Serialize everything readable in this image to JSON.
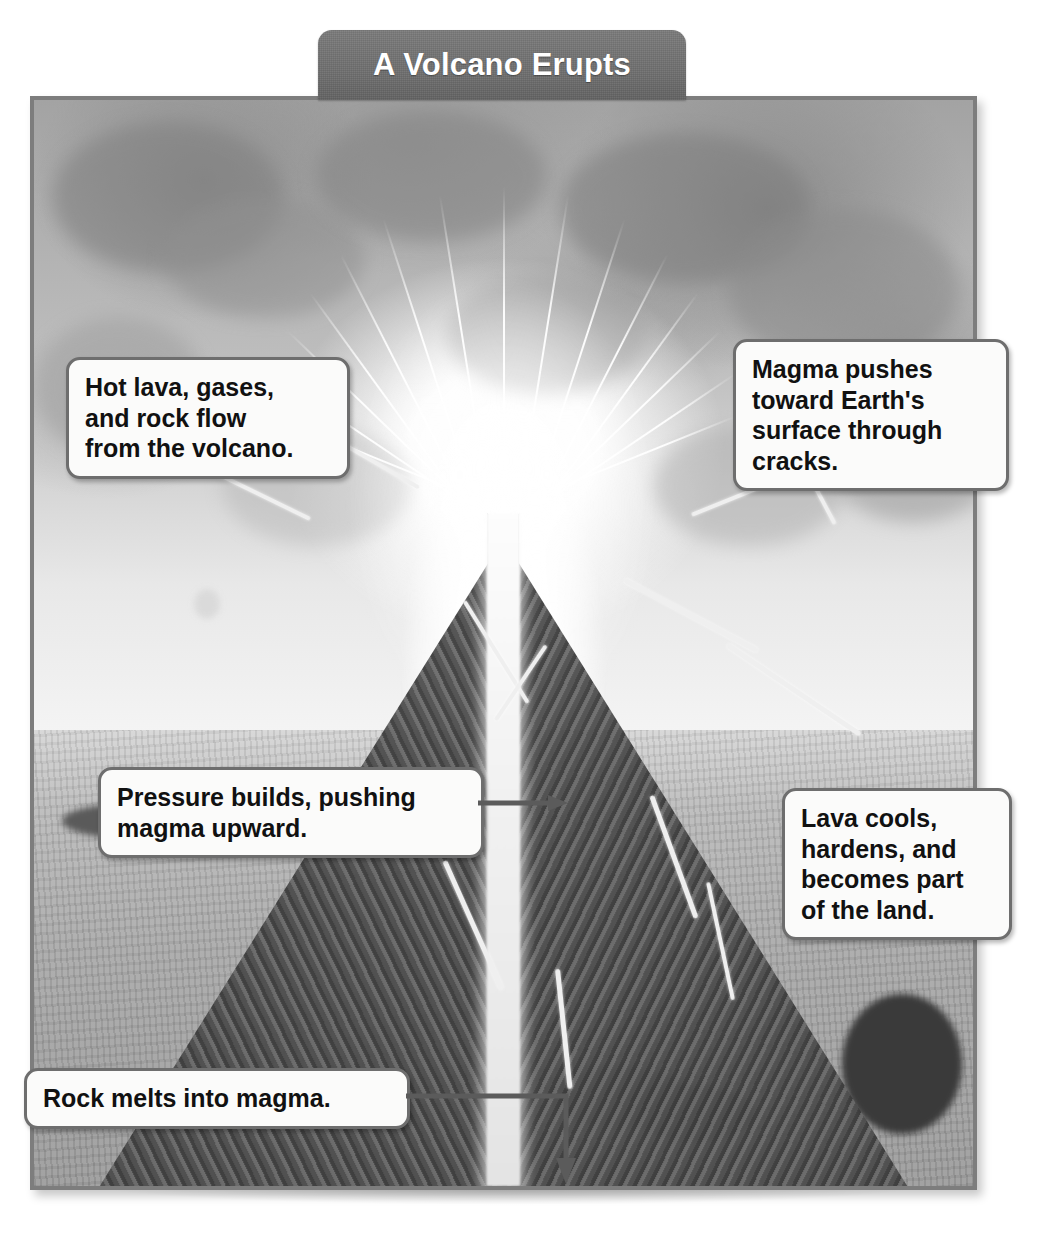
{
  "title": {
    "text": "A Volcano Erupts"
  },
  "figure": {
    "alt": "Grayscale cut-away illustration of an erupting volcano"
  },
  "callouts": [
    {
      "id": "lava",
      "name": "callout-hot-lava",
      "lines": [
        "Hot lava, gases,",
        "and rock flow",
        "from the volcano."
      ]
    },
    {
      "id": "magma",
      "name": "callout-magma-pushes",
      "lines": [
        "Magma pushes",
        "toward Earth's",
        "surface through",
        "cracks."
      ]
    },
    {
      "id": "pressure",
      "name": "callout-pressure-builds",
      "lines": [
        "Pressure builds, pushing",
        "magma upward."
      ]
    },
    {
      "id": "cools",
      "name": "callout-lava-cools",
      "lines": [
        "Lava cools,",
        "hardens, and",
        "becomes part",
        "of the land."
      ]
    },
    {
      "id": "rock",
      "name": "callout-rock-melts",
      "lines": [
        "Rock melts into magma."
      ]
    }
  ],
  "arrows": [
    {
      "id": "pressure-arrow",
      "direction": "right",
      "from": "callout-pressure-builds",
      "to": "volcano-vent"
    },
    {
      "id": "rock-arrow",
      "direction": "right-then-down",
      "from": "callout-rock-melts",
      "to": "magma-chamber"
    }
  ],
  "colors": {
    "banner_gray": "#6f6f6f",
    "callout_border": "#6e6e6e",
    "callout_fill": "#fbfbfa",
    "frame_border": "#7d7d7d",
    "text": "#111111",
    "banner_text": "#ffffff"
  }
}
